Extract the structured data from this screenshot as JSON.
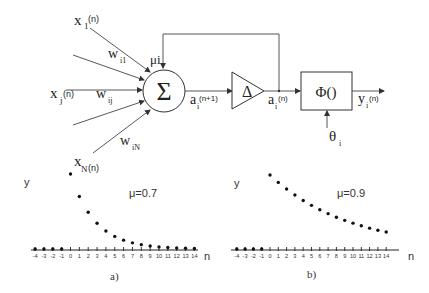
{
  "diagram": {
    "inputs": [
      {
        "label": "x",
        "sub": "1",
        "arg": "(n)"
      },
      {
        "label": "x",
        "sub": "j",
        "arg": "(n)"
      },
      {
        "label": "x",
        "sub": "N",
        "arg": "(n)"
      }
    ],
    "weights": [
      {
        "label": "w",
        "sub": "i1"
      },
      {
        "label": "w",
        "sub": "ij"
      },
      {
        "label": "w",
        "sub": "iN"
      }
    ],
    "feedback_gain": "μi",
    "summation_symbol": "Σ",
    "sum_output": {
      "label": "a",
      "sub": "i",
      "arg": "(n+1)"
    },
    "delay_symbol": "Δ",
    "delay_output": {
      "label": "a",
      "sub": "i",
      "arg": "(n)"
    },
    "activation": "Φ()",
    "threshold": {
      "label": "θ",
      "sub": "i"
    },
    "output": {
      "label": "y",
      "sub": "i",
      "arg": "(n)"
    }
  },
  "chart_data": [
    {
      "type": "scatter",
      "panel": "a)",
      "ylabel": "y",
      "xlabel": "n",
      "annotation": "μ=0.7",
      "x_ticks": [
        -4,
        -3,
        -2,
        -1,
        0,
        1,
        2,
        3,
        4,
        5,
        6,
        7,
        8,
        9,
        10,
        11,
        12,
        13,
        14
      ],
      "x": [
        -4,
        -3,
        -2,
        -1,
        0,
        1,
        2,
        3,
        4,
        5,
        6,
        7,
        8,
        9,
        10,
        11,
        12,
        13,
        14
      ],
      "values": [
        0,
        0,
        0,
        0,
        1.0,
        0.7,
        0.49,
        0.343,
        0.24,
        0.168,
        0.118,
        0.082,
        0.058,
        0.04,
        0.028,
        0.02,
        0.014,
        0.01,
        0.007
      ]
    },
    {
      "type": "scatter",
      "panel": "b)",
      "ylabel": "y",
      "xlabel": "n",
      "annotation": "μ=0.9",
      "x_ticks": [
        -4,
        -3,
        -2,
        -1,
        0,
        1,
        2,
        3,
        4,
        5,
        6,
        7,
        8,
        9,
        10,
        11,
        12,
        13,
        14
      ],
      "x": [
        -4,
        -3,
        -2,
        -1,
        0,
        1,
        2,
        3,
        4,
        5,
        6,
        7,
        8,
        9,
        10,
        11,
        12,
        13,
        14
      ],
      "values": [
        0,
        0,
        0,
        0,
        1.0,
        0.9,
        0.81,
        0.729,
        0.656,
        0.59,
        0.531,
        0.478,
        0.43,
        0.387,
        0.349,
        0.314,
        0.282,
        0.254,
        0.229
      ]
    }
  ]
}
